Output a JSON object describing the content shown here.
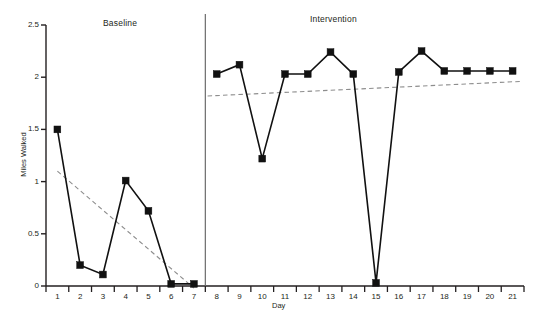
{
  "chart_data": {
    "type": "line",
    "title": "",
    "xlabel": "Day",
    "ylabel": "Miles Walked",
    "xlim": [
      0.5,
      21.5
    ],
    "ylim": [
      0,
      2.5
    ],
    "grid": false,
    "legend_position": "none",
    "x_tick_labels": [
      "1",
      "2",
      "3",
      "4",
      "5",
      "6",
      "7",
      "8",
      "9",
      "10",
      "11",
      "12",
      "13",
      "14",
      "15",
      "16",
      "17",
      "18",
      "19",
      "20",
      "21"
    ],
    "y_tick_labels": [
      "0",
      "0.5",
      "1",
      "1.5",
      "2",
      "2.5"
    ],
    "y_tick_values": [
      0,
      0.5,
      1,
      1.5,
      2,
      2.5
    ],
    "phase_divider_x": 7.5,
    "phases": [
      {
        "name": "Baseline",
        "x_start": 1,
        "x_end": 7
      },
      {
        "name": "Intervention",
        "x_start": 8,
        "x_end": 21
      }
    ],
    "series": [
      {
        "name": "Baseline",
        "style": "solid-with-square-markers",
        "color": "#111111",
        "x": [
          1,
          2,
          3,
          4,
          5,
          6,
          7
        ],
        "values": [
          1.5,
          0.2,
          0.11,
          1.01,
          0.72,
          0.02,
          0.02
        ]
      },
      {
        "name": "Intervention",
        "style": "solid-with-square-markers",
        "color": "#111111",
        "x": [
          8,
          9,
          10,
          11,
          12,
          13,
          14,
          15,
          16,
          17,
          18,
          19,
          20,
          21
        ],
        "values": [
          2.03,
          2.12,
          1.22,
          2.03,
          2.03,
          2.24,
          2.03,
          0.03,
          2.05,
          2.25,
          2.06,
          2.06,
          2.06,
          2.06
        ]
      }
    ],
    "trendlines": [
      {
        "name": "Baseline trend",
        "style": "dashed",
        "color": "#8d8d8d",
        "x": [
          1,
          7
        ],
        "values": [
          1.1,
          -0.02
        ]
      },
      {
        "name": "Intervention trend",
        "style": "dashed",
        "color": "#8d8d8d",
        "x": [
          7.6,
          21.4
        ],
        "values": [
          1.82,
          1.96
        ]
      }
    ]
  },
  "labels": {
    "phase_baseline": "Baseline",
    "phase_intervention": "Intervention",
    "axis_y_title": "Miles Walked",
    "axis_x_title": "Day"
  }
}
